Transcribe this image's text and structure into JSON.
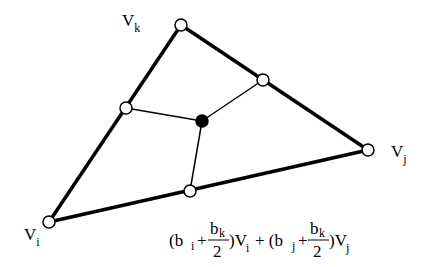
{
  "vertices": {
    "vk": {
      "label": "V",
      "sub": "k"
    },
    "vi": {
      "label": "V",
      "sub": "i"
    },
    "vj": {
      "label": "V",
      "sub": "j"
    }
  },
  "formula": {
    "open1": "(b",
    "sub_i": "i",
    "plus1": "+",
    "frac_num1": "b",
    "frac_num1_sub": "k",
    "frac_den1": "2",
    "close1": ")V",
    "close1_sub": "i",
    "plus_mid": "+ (b",
    "sub_j": "j",
    "plus2": "+",
    "frac_num2": "b",
    "frac_num2_sub": "k",
    "frac_den2": "2",
    "close2": ")V",
    "close2_sub": "j"
  }
}
